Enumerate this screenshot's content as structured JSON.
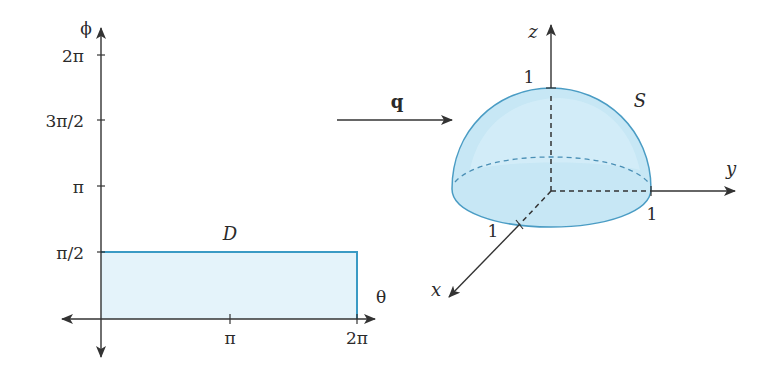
{
  "colors": {
    "region_fill": "#e4f3fa",
    "region_stroke": "#3a9ac4",
    "hemisphere_fill": "#bfe3f3",
    "hemisphere_stroke": "#4a9cc4",
    "axis": "#333333",
    "text": "#2a2a2a"
  },
  "left_plot": {
    "vertical_axis_label": "ϕ",
    "horizontal_axis_label": "θ",
    "vertical_ticks": [
      {
        "label": "2π",
        "y": 55
      },
      {
        "label": "3π/2",
        "y": 120
      },
      {
        "label": "π",
        "y": 186
      },
      {
        "label": "π/2",
        "y": 252
      }
    ],
    "horizontal_ticks": [
      {
        "label": "π",
        "x": 230
      },
      {
        "label": "2π",
        "x": 357
      }
    ],
    "region": {
      "label": "D",
      "theta_range": [
        "0",
        "2π"
      ],
      "phi_range": [
        "0",
        "π/2"
      ]
    }
  },
  "mapping": {
    "label": "q"
  },
  "right_plot": {
    "surface_label": "S",
    "axes": {
      "x": "x",
      "y": "y",
      "z": "z"
    },
    "unit_labels": {
      "z": "1",
      "y": "1",
      "x": "1"
    }
  }
}
